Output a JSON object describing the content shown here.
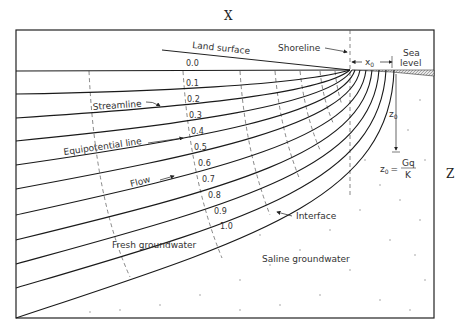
{
  "diagram": {
    "type": "coastal aquifer flow net cross-section",
    "axis_labels": {
      "x": "X",
      "z": "Z"
    },
    "labels": {
      "land_surface": "Land surface",
      "shoreline": "Shoreline",
      "sea_level_line1": "Sea",
      "sea_level_line2": "level",
      "x0": "x",
      "x0_sub": "0",
      "z0": "z",
      "z0_sub": "0",
      "formula_lhs": "z",
      "formula_lhs_sub": "0",
      "formula_eq": "=",
      "formula_num": "Gq",
      "formula_den": "K",
      "streamline": "Streamline",
      "equipotential_line": "Equipotential line",
      "flow": "Flow",
      "interface": "Interface",
      "fresh_groundwater": "Fresh groundwater",
      "saline_groundwater": "Saline groundwater"
    },
    "streamline_values": [
      "0.0",
      "0.1",
      "0.2",
      "0.3",
      "0.4",
      "0.5",
      "0.6",
      "0.7",
      "0.8",
      "0.9",
      "1.0"
    ],
    "colors": {
      "line": "#1a1a1a",
      "dashed": "#555555",
      "text": "#333333",
      "sea": "#bbbbbb"
    }
  }
}
